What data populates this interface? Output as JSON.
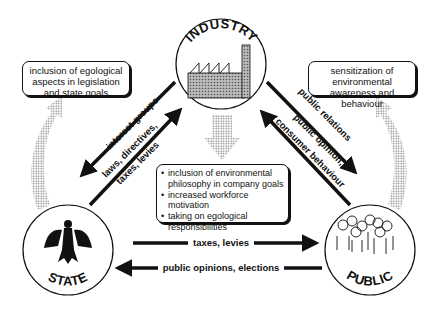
{
  "nodes": {
    "industry": {
      "label": "INDUSTRY",
      "icon": "factory-icon"
    },
    "state": {
      "label": "STATE",
      "icon": "eagle-coat-of-arms-icon"
    },
    "public": {
      "label": "PUBLIC",
      "icon": "crowd-icon"
    }
  },
  "boxes": {
    "left": "inclusion of egological aspects in legislation and state goals",
    "right": "sensitization of environmental awareness and behaviour",
    "center": [
      "inclusion of environmental philosophy in company goals",
      "increased workforce motivation",
      "taking on egological responsibilities"
    ]
  },
  "arrows": {
    "state_to_industry_outer": "interest groups",
    "industry_to_state_inner": "laws, directives,",
    "industry_to_state_inner2": "taxes, levies",
    "industry_to_public_outer": "public relations",
    "public_to_industry_inner": "public opinion,",
    "public_to_industry_inner2": "consumer behaviour",
    "state_to_public": "taxes, levies",
    "public_to_state": "public opinions, elections"
  },
  "colors": {
    "ink": "#111111",
    "dots": "#888888",
    "background": "#ffffff"
  }
}
